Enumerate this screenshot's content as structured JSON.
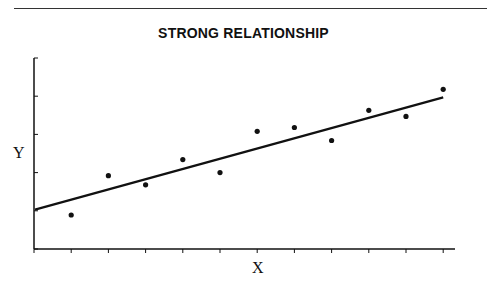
{
  "chart_data": {
    "type": "scatter",
    "title": "STRONG RELATIONSHIP",
    "xlabel": "X",
    "ylabel": "Y",
    "xlim": [
      0,
      11.3
    ],
    "ylim": [
      0,
      5
    ],
    "x_ticks": [
      0,
      1,
      2,
      3,
      4,
      5,
      6,
      7,
      8,
      9,
      10,
      11
    ],
    "y_ticks": [
      0,
      1,
      2,
      3,
      4,
      5
    ],
    "tick_labels_shown": false,
    "grid": false,
    "legend": null,
    "series": [
      {
        "name": "observations",
        "x": [
          1,
          2,
          3,
          4,
          5,
          6,
          7,
          8,
          9,
          10,
          11
        ],
        "y": [
          0.89,
          1.92,
          1.68,
          2.34,
          2.0,
          3.08,
          3.18,
          2.84,
          3.63,
          3.47,
          4.18
        ]
      }
    ],
    "trend_line": {
      "x": [
        0,
        11
      ],
      "y": [
        1.03,
        3.97
      ]
    }
  },
  "colors": {
    "ink": "#111111",
    "background": "#ffffff"
  }
}
